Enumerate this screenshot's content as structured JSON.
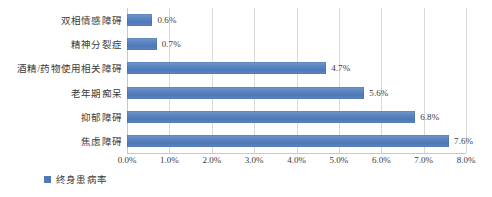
{
  "chart_data": {
    "type": "bar",
    "orientation": "horizontal",
    "title": "",
    "xlabel": "",
    "ylabel": "",
    "categories": [
      "双相情感障碍",
      "精神分裂症",
      "酒精/药物使用相关障碍",
      "老年期痴呆",
      "抑郁障碍",
      "焦虑障碍"
    ],
    "values": [
      0.6,
      0.7,
      4.7,
      5.6,
      6.8,
      7.6
    ],
    "value_labels": [
      "0.6%",
      "0.7%",
      "4.7%",
      "5.6%",
      "6.8%",
      "7.6%"
    ],
    "series": [
      {
        "name": "终身患病率",
        "values": [
          0.6,
          0.7,
          4.7,
          5.6,
          6.8,
          7.6
        ],
        "color": "#4f79b8"
      }
    ],
    "xlim": [
      0,
      8
    ],
    "xticks": [
      0,
      1,
      2,
      3,
      4,
      5,
      6,
      7,
      8
    ],
    "xtick_labels": [
      "0.0%",
      "1.0%",
      "2.0%",
      "3.0%",
      "4.0%",
      "5.0%",
      "6.0%",
      "7.0%",
      "8.0%"
    ],
    "grid": "vertical",
    "legend": {
      "position": "bottom-left",
      "entries": [
        "终身患病率"
      ]
    }
  },
  "legend": {
    "label": "终身患病率",
    "swatch_color": "#4f79b8"
  },
  "colors": {
    "bar": "#4f79b8",
    "grid": "#d9d9d9",
    "text": "#3a3a3a",
    "background": "#ffffff"
  }
}
